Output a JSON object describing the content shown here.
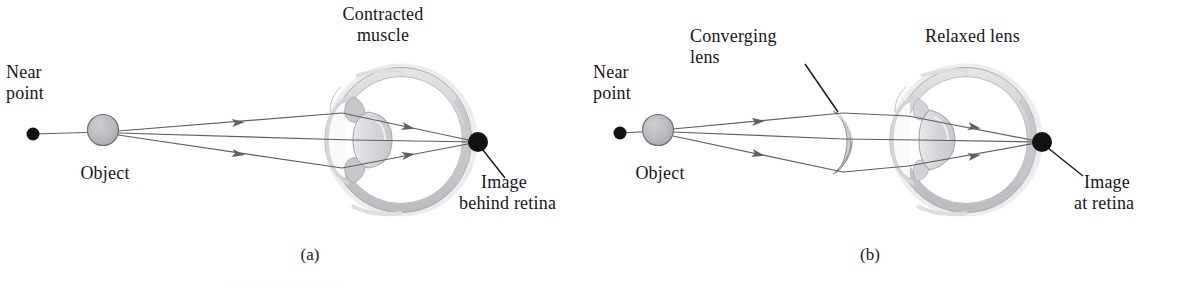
{
  "figure": {
    "title_hidden": "",
    "background_color": "#ffffff",
    "ink_color": "#17151a",
    "ray_color": "#5a5a62",
    "eye_outline_color": "#8e8e95",
    "eye_fill_color": "#d2d2d6",
    "eye_highlight_color": "#efeff1",
    "lens_fill_color": "#d9d9dd",
    "object_fill_color": "#b6b6bb",
    "dot_color": "#111111"
  },
  "panels": [
    {
      "id": "a",
      "caption": "(a)",
      "labels": {
        "near_point": "Near\npoint",
        "near_point_line1": "Near",
        "near_point_line2": "point",
        "object": "Object",
        "top_label_line1": "Contracted",
        "top_label_line2": "muscle",
        "image_line1": "Image",
        "image_line2": "behind retina"
      },
      "points": {
        "near_point_dot": {
          "x": 33,
          "y": 134
        },
        "object_center": {
          "x": 103,
          "y": 130,
          "r": 15
        },
        "eye_center": {
          "x": 400,
          "y": 140,
          "r": 67
        },
        "image_dot": {
          "x": 478,
          "y": 142,
          "r": 10
        }
      },
      "has_correcting_lens": false,
      "image_location": "behind retina"
    },
    {
      "id": "b",
      "caption": "(b)",
      "labels": {
        "near_point": "Near\npoint",
        "near_point_line1": "Near",
        "near_point_line2": "point",
        "object": "Object",
        "lens_label_line1": "Converging",
        "lens_label_line2": "lens",
        "top_label": "Relaxed lens",
        "image_line1": "Image",
        "image_line2": "at retina"
      },
      "points": {
        "near_point_dot": {
          "x": 620,
          "y": 133
        },
        "object_center": {
          "x": 658,
          "y": 130,
          "r": 15
        },
        "converging_lens_x": 845,
        "eye_center": {
          "x": 965,
          "y": 140,
          "r": 67
        },
        "image_dot": {
          "x": 1042,
          "y": 142,
          "r": 10
        }
      },
      "has_correcting_lens": true,
      "image_location": "at retina"
    }
  ],
  "bottom_trimmed_text": "·  ·  ·   ·  ·   ·  ·  ·  ·  ·    ·  ·  ·   ·  ·  ·   ·  ·"
}
